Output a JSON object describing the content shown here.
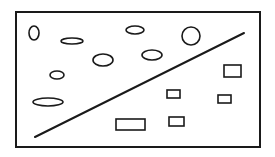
{
  "diagram": {
    "width": 275,
    "height": 157,
    "stroke_color": "#1a1a1a",
    "background": "#ffffff",
    "frame": {
      "x": 16,
      "y": 12,
      "width": 244,
      "height": 135
    },
    "divider_line": {
      "x1": 35,
      "y1": 137,
      "x2": 244,
      "y2": 33
    },
    "ellipses": [
      {
        "cx": 34,
        "cy": 33,
        "rx": 5,
        "ry": 7
      },
      {
        "cx": 72,
        "cy": 41,
        "rx": 11,
        "ry": 3
      },
      {
        "cx": 135,
        "cy": 30,
        "rx": 9,
        "ry": 4
      },
      {
        "cx": 191,
        "cy": 36,
        "rx": 9,
        "ry": 9
      },
      {
        "cx": 152,
        "cy": 55,
        "rx": 10,
        "ry": 5
      },
      {
        "cx": 103,
        "cy": 60,
        "rx": 10,
        "ry": 6
      },
      {
        "cx": 57,
        "cy": 75,
        "rx": 7,
        "ry": 4
      },
      {
        "cx": 48,
        "cy": 102,
        "rx": 15,
        "ry": 4
      }
    ],
    "rectangles": [
      {
        "x": 224,
        "y": 65,
        "width": 17,
        "height": 12
      },
      {
        "x": 167,
        "y": 90,
        "width": 13,
        "height": 8
      },
      {
        "x": 218,
        "y": 95,
        "width": 13,
        "height": 8
      },
      {
        "x": 116,
        "y": 119,
        "width": 29,
        "height": 11
      },
      {
        "x": 169,
        "y": 117,
        "width": 15,
        "height": 9
      }
    ]
  }
}
